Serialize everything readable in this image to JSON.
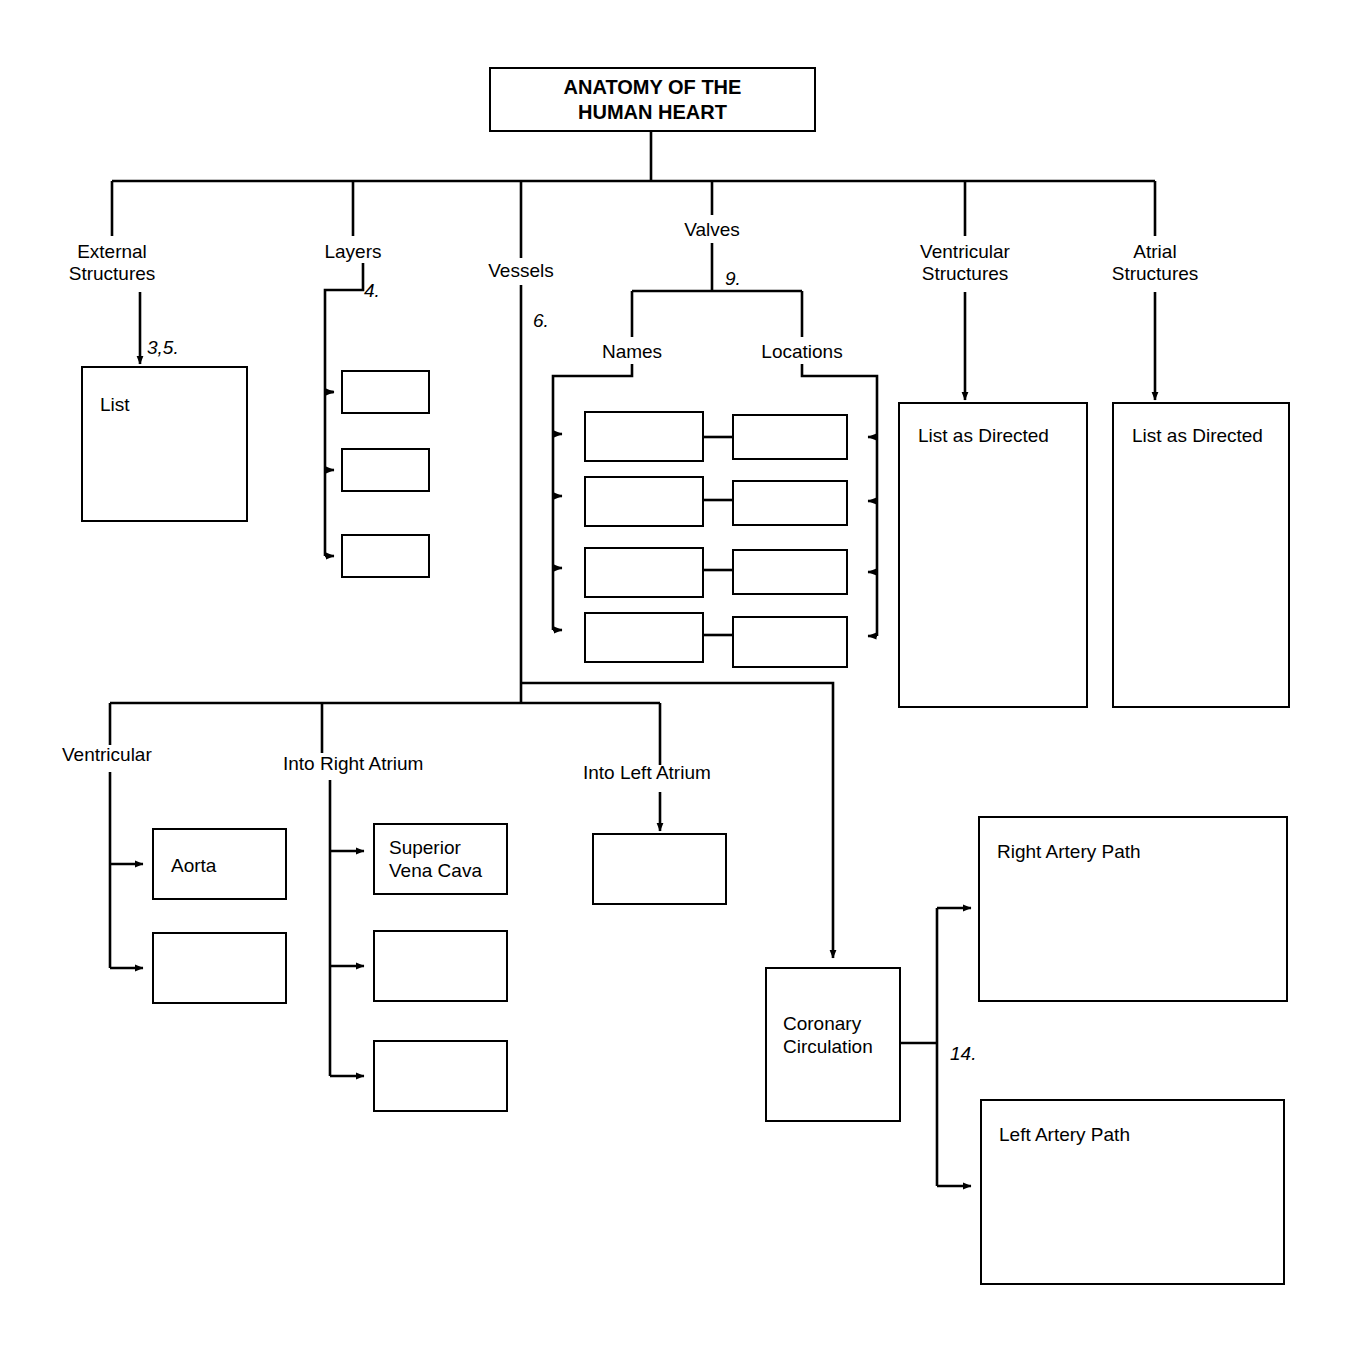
{
  "document": {
    "type": "concept-map-worksheet",
    "title": "ANATOMY OF THE\nHUMAN HEART"
  },
  "root": {
    "label": "ANATOMY OF THE\nHUMAN HEART"
  },
  "branches": [
    {
      "id": "external-structures",
      "label": "External\nStructures"
    },
    {
      "id": "layers",
      "label": "Layers"
    },
    {
      "id": "vessels",
      "label": "Vessels"
    },
    {
      "id": "valves",
      "label": "Valves"
    },
    {
      "id": "ventricular-structures",
      "label": "Ventricular\nStructures"
    },
    {
      "id": "atrial-structures",
      "label": "Atrial\nStructures"
    }
  ],
  "sub_branches": [
    {
      "id": "names",
      "label": "Names"
    },
    {
      "id": "locations",
      "label": "Locations"
    },
    {
      "id": "ventricular-vessels",
      "label": "Ventricular"
    },
    {
      "id": "into-right-atrium",
      "label": "Into Right Atrium"
    },
    {
      "id": "into-left-atrium",
      "label": "Into Left Atrium"
    }
  ],
  "step_numbers": [
    {
      "id": "step-3-5",
      "text": "3,5."
    },
    {
      "id": "step-4",
      "text": "4."
    },
    {
      "id": "step-6",
      "text": "6."
    },
    {
      "id": "step-9",
      "text": "9."
    },
    {
      "id": "step-14",
      "text": "14."
    }
  ],
  "boxes": {
    "external_list": {
      "label": "List"
    },
    "layers": [
      {
        "label": ""
      },
      {
        "label": ""
      },
      {
        "label": ""
      }
    ],
    "valve_names": [
      {
        "label": ""
      },
      {
        "label": ""
      },
      {
        "label": ""
      },
      {
        "label": ""
      }
    ],
    "valve_locations": [
      {
        "label": ""
      },
      {
        "label": ""
      },
      {
        "label": ""
      },
      {
        "label": ""
      }
    ],
    "ventricular_list": {
      "label": "List as Directed"
    },
    "atrial_list": {
      "label": "List as Directed"
    },
    "ventricular_vessels": [
      {
        "label": "Aorta"
      },
      {
        "label": ""
      }
    ],
    "into_right_atrium": [
      {
        "label": "Superior\nVena Cava"
      },
      {
        "label": ""
      },
      {
        "label": ""
      }
    ],
    "into_left_atrium": [
      {
        "label": ""
      }
    ],
    "coronary": {
      "label": "Coronary\nCirculation"
    },
    "right_artery": {
      "label": "Right Artery Path"
    },
    "left_artery": {
      "label": "Left Artery Path"
    }
  },
  "colors": {
    "line": "#000000",
    "background": "#ffffff",
    "text": "#000000"
  }
}
